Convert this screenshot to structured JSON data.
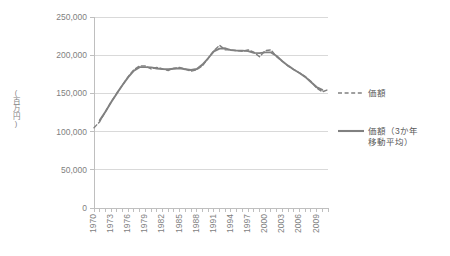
{
  "chart_data": {
    "type": "line",
    "title": "",
    "xlabel": "",
    "ylabel": "(百万円)",
    "ylim": [
      0,
      250000
    ],
    "ytick_labels": [
      "0",
      "50,000",
      "100,000",
      "150,000",
      "200,000",
      "250,000"
    ],
    "ytick_values": [
      0,
      50000,
      100000,
      150000,
      200000,
      250000
    ],
    "grid": true,
    "grid_axis": "y",
    "legend_position": "right",
    "xlim": [
      1970,
      2011
    ],
    "xtick_labels": [
      "1970",
      "1973",
      "1976",
      "1979",
      "1982",
      "1985",
      "1988",
      "1991",
      "1994",
      "1997",
      "2000",
      "2003",
      "2006",
      "2009"
    ],
    "x": [
      1970,
      1971,
      1972,
      1973,
      1974,
      1975,
      1976,
      1977,
      1978,
      1979,
      1980,
      1981,
      1982,
      1983,
      1984,
      1985,
      1986,
      1987,
      1988,
      1989,
      1990,
      1991,
      1992,
      1993,
      1994,
      1995,
      1996,
      1997,
      1998,
      1999,
      2000,
      2001,
      2002,
      2003,
      2004,
      2005,
      2006,
      2007,
      2008,
      2009,
      2010,
      2011
    ],
    "series": [
      {
        "name": "価額",
        "style": "dashed",
        "color": "#808080",
        "values": [
          105000,
          113000,
          126000,
          139000,
          150000,
          161000,
          172000,
          181000,
          186000,
          186000,
          182000,
          184000,
          182000,
          180000,
          183000,
          184000,
          182000,
          179000,
          181000,
          186000,
          196000,
          206000,
          213000,
          207000,
          207000,
          206000,
          205000,
          207000,
          204000,
          198000,
          206000,
          207000,
          198000,
          192000,
          186000,
          181000,
          177000,
          172000,
          166000,
          157000,
          152000,
          155000
        ]
      },
      {
        "name": "価額（3か年\n移動平均）",
        "name_line1": "価額（3か年",
        "name_line2": "移動平均）",
        "style": "solid",
        "color": "#808080",
        "values": [
          null,
          114667,
          126000,
          138333,
          150000,
          161000,
          171333,
          179667,
          184333,
          184333,
          184000,
          182667,
          182000,
          181667,
          182333,
          183000,
          181667,
          180667,
          182000,
          187667,
          196000,
          205000,
          208667,
          209000,
          206667,
          206000,
          206000,
          205333,
          203000,
          202667,
          203667,
          203667,
          199000,
          192000,
          186333,
          181333,
          176667,
          171667,
          165000,
          158333,
          154667,
          null
        ]
      }
    ]
  },
  "axis": {
    "y_axis_title": "(百万円)"
  },
  "legend": {
    "items": [
      {
        "label": "価額",
        "style": "dashed",
        "color": "#808080"
      },
      {
        "label_line1": "価額（3か年",
        "label_line2": "移動平均）",
        "style": "solid",
        "color": "#808080"
      }
    ]
  }
}
